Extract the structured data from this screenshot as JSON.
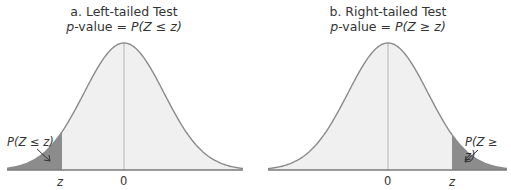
{
  "panels": [
    {
      "title": "a. Left-tailed Test",
      "subtitle_prefix": "p",
      "subtitle_mid": "-value = ",
      "subtitle_formula": "P(Z ≤ z)",
      "shade_label": "P(Z ≤ z)",
      "tick_z": "z",
      "tick_zero": "0",
      "tail": "left"
    },
    {
      "title": "b. Right-tailed Test",
      "subtitle_prefix": "p",
      "subtitle_mid": "-value = ",
      "subtitle_formula": "P(Z ≥ z)",
      "shade_label": "P(Z ≥ z)",
      "tick_z": "z",
      "tick_zero": "0",
      "tail": "right"
    }
  ],
  "colors": {
    "curve": "#8a8a8a",
    "fill": "#f0f0f0",
    "shade": "#8c8c8c",
    "axis": "#7a7a7a"
  }
}
